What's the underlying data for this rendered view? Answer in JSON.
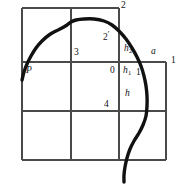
{
  "figure": {
    "kind": "line-diagram",
    "canvas": {
      "width": 181,
      "height": 196
    },
    "colors": {
      "background": "#ffffff",
      "grid_stroke": "#4a4a4a",
      "curve_stroke": "#111111"
    },
    "grid": {
      "description": "Rectangular grid of cells with an extra right-hand column offset below the top row",
      "vertical_x": [
        22,
        71,
        119,
        166
      ],
      "horizontal_y": [
        8,
        62,
        111,
        160
      ],
      "top_row_span_x": [
        22,
        119
      ],
      "right_column_span_y": [
        62,
        160
      ]
    },
    "curve": {
      "name": "profile-curve",
      "stroke_width": 3.4,
      "points": [
        [
          22,
          80
        ],
        [
          24,
          72
        ],
        [
          27,
          64
        ],
        [
          31,
          56
        ],
        [
          36,
          48
        ],
        [
          42,
          41
        ],
        [
          49,
          35
        ],
        [
          56,
          31
        ],
        [
          62,
          28
        ],
        [
          67,
          25
        ],
        [
          71,
          22
        ],
        [
          76,
          20
        ],
        [
          84,
          19
        ],
        [
          94,
          19
        ],
        [
          104,
          21
        ],
        [
          112,
          25
        ],
        [
          119,
          31
        ],
        [
          126,
          39
        ],
        [
          132,
          48
        ],
        [
          137,
          57
        ],
        [
          141,
          66
        ],
        [
          144,
          76
        ],
        [
          146,
          86
        ],
        [
          147,
          96
        ],
        [
          147,
          106
        ],
        [
          146,
          116
        ],
        [
          143,
          125
        ],
        [
          139,
          133
        ],
        [
          134,
          141
        ],
        [
          130,
          149
        ],
        [
          127,
          158
        ],
        [
          125,
          167
        ],
        [
          124,
          175
        ],
        [
          124,
          182
        ]
      ]
    },
    "labels": [
      {
        "id": "label-2",
        "text": "2",
        "style": "plain",
        "x": 121,
        "y": 1
      },
      {
        "id": "label-2-prime",
        "text": "2",
        "prime": true,
        "style": "prime",
        "x": 103,
        "y": 30
      },
      {
        "id": "label-3",
        "text": "3",
        "style": "plain",
        "x": 74,
        "y": 48
      },
      {
        "id": "label-h2",
        "text": "h",
        "sub": "2",
        "style": "sub",
        "x": 124,
        "y": 44
      },
      {
        "id": "label-a",
        "text": "a",
        "style": "italic",
        "x": 151,
        "y": 47
      },
      {
        "id": "label-1",
        "text": "1",
        "style": "plain",
        "x": 171,
        "y": 56
      },
      {
        "id": "label-P",
        "text": "P",
        "style": "italic",
        "x": 26,
        "y": 66
      },
      {
        "id": "label-0",
        "text": "0",
        "style": "plain",
        "x": 110,
        "y": 66
      },
      {
        "id": "label-h1",
        "text": "h",
        "sub": "1",
        "style": "sub",
        "x": 123,
        "y": 66
      },
      {
        "id": "label-1-prime",
        "text": "1",
        "prime": true,
        "style": "prime",
        "x": 136,
        "y": 65
      },
      {
        "id": "label-h",
        "text": "h",
        "style": "italic",
        "x": 125,
        "y": 89
      },
      {
        "id": "label-4",
        "text": "4",
        "style": "plain",
        "x": 104,
        "y": 100
      }
    ]
  }
}
